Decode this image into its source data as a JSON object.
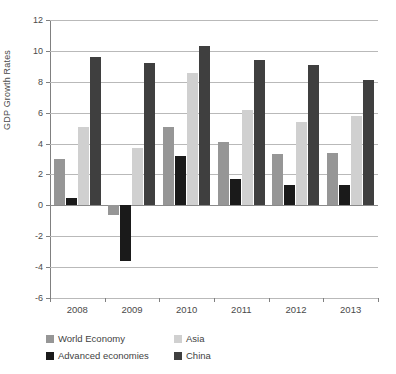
{
  "chart_data": {
    "type": "bar",
    "title": "",
    "xlabel": "",
    "ylabel": "GDP Growth Rates",
    "categories": [
      "2008",
      "2009",
      "2010",
      "2011",
      "2012",
      "2013"
    ],
    "series": [
      {
        "name": "World Economy",
        "color": "#969696",
        "values": [
          3.0,
          -0.6,
          5.1,
          4.1,
          3.3,
          3.4
        ]
      },
      {
        "name": "Advanced economies",
        "color": "#1a1a1a",
        "values": [
          0.5,
          -3.6,
          3.2,
          1.7,
          1.3,
          1.3
        ]
      },
      {
        "name": "Asia",
        "color": "#d0d0d0",
        "values": [
          5.1,
          3.7,
          8.6,
          6.2,
          5.4,
          5.8
        ]
      },
      {
        "name": "China",
        "color": "#3f3f3f",
        "values": [
          9.6,
          9.2,
          10.3,
          9.4,
          9.1,
          8.1
        ]
      }
    ],
    "ylim": [
      -6,
      12
    ],
    "ytick_step": 2,
    "yticks": [
      12,
      10,
      8,
      6,
      4,
      2,
      0,
      -2,
      -4,
      -6
    ],
    "ytick_labels": [
      "12",
      "10",
      "8",
      "6",
      "4",
      "2",
      "0",
      "-2",
      "-4",
      "-6"
    ],
    "grid": true,
    "legend_position": "bottom-left"
  },
  "legend": {
    "rows": [
      [
        {
          "label": "World Economy",
          "color": "#969696"
        },
        {
          "label": "Asia",
          "color": "#d0d0d0"
        }
      ],
      [
        {
          "label": "Advanced economies",
          "color": "#1a1a1a"
        },
        {
          "label": "China",
          "color": "#3f3f3f"
        }
      ]
    ]
  }
}
